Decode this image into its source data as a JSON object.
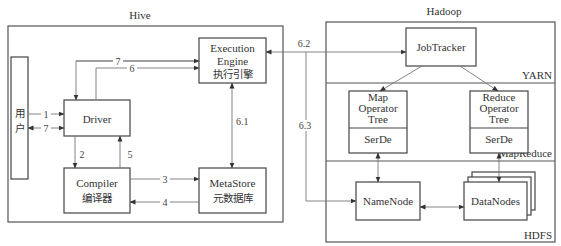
{
  "hive": {
    "title": "Hive",
    "user": {
      "line1": "用",
      "line2": "户"
    },
    "driver": {
      "label": "Driver"
    },
    "compiler": {
      "line1": "Compiler",
      "line2": "编译器"
    },
    "execution_engine": {
      "line1": "Execution",
      "line2": "Engine",
      "line3": "执行引擎"
    },
    "metastore": {
      "line1": "MetaStore",
      "line2": "元数据库"
    }
  },
  "hadoop": {
    "title": "Hadoop",
    "yarn_label": "YARN",
    "mapreduce_label": "MapReduce",
    "hdfs_label": "HDFS",
    "jobtracker": {
      "label": "JobTracker"
    },
    "map_tree": {
      "line1": "Map",
      "line2": "Operator",
      "line3": "Tree",
      "serde": "SerDe"
    },
    "reduce_tree": {
      "line1": "Reduce",
      "line2": "Operator",
      "line3": "Tree",
      "serde": "SerDe"
    },
    "namenode": {
      "label": "NameNode"
    },
    "datanodes": {
      "label": "DataNodes"
    }
  },
  "edges": {
    "e1": "1",
    "e7_user": "7",
    "e2": "2",
    "e5": "5",
    "e3": "3",
    "e4": "4",
    "e6": "6",
    "e7_top": "7",
    "e6_1": "6.1",
    "e6_2": "6.2",
    "e6_3": "6.3"
  },
  "colors": {
    "line": "#777777",
    "box_stroke": "#444444",
    "text": "#333333"
  }
}
